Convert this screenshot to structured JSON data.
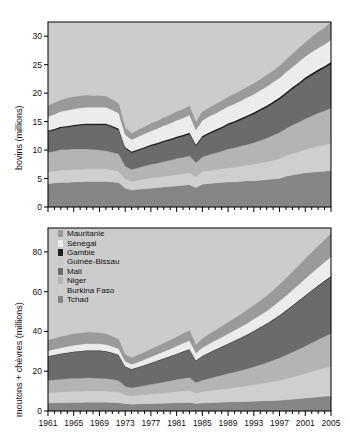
{
  "figure": {
    "background": "#ffffff",
    "plot_background": "#cccccc"
  },
  "legend": {
    "position": "inside-bottom-panel-top-left",
    "entries": [
      {
        "label": "Mauritanie",
        "color": "#9a9a9a"
      },
      {
        "label": "Sénégal",
        "color": "#ececec"
      },
      {
        "label": "Gambie",
        "color": "#1e1e1e"
      },
      {
        "label": "Guinée-Bissau",
        "color": "#c6c6c6"
      },
      {
        "label": "Mali",
        "color": "#6b6b6b"
      },
      {
        "label": "Niger",
        "color": "#b4b4b4"
      },
      {
        "label": "Burkina Faso",
        "color": "#cfcfcf"
      },
      {
        "label": "Tchad",
        "color": "#858585"
      }
    ]
  },
  "chart_data": [
    {
      "type": "area",
      "id": "bovins",
      "title": "",
      "xlabel": "",
      "ylabel": "bovins (millions)",
      "stacked": true,
      "grid": false,
      "xlim": [
        1961,
        2005
      ],
      "ylim": [
        0,
        32.5
      ],
      "yticks": [
        0,
        5,
        10,
        15,
        20,
        25,
        30
      ],
      "ytick_labels": [
        "0",
        "5",
        "10",
        "15",
        "20",
        "25",
        "30"
      ],
      "xticks": [
        1961,
        1965,
        1969,
        1973,
        1977,
        1981,
        1985,
        1989,
        1993,
        1997,
        2001,
        2005
      ],
      "xtick_labels": [
        "1961",
        "1965",
        "1969",
        "1973",
        "1977",
        "1981",
        "1985",
        "1989",
        "1993",
        "1997",
        "2001",
        "2005"
      ],
      "x": [
        1961,
        1962,
        1963,
        1964,
        1965,
        1966,
        1967,
        1968,
        1969,
        1970,
        1971,
        1972,
        1973,
        1974,
        1975,
        1976,
        1977,
        1978,
        1979,
        1980,
        1981,
        1982,
        1983,
        1984,
        1985,
        1986,
        1987,
        1988,
        1989,
        1990,
        1991,
        1992,
        1993,
        1994,
        1995,
        1996,
        1997,
        1998,
        1999,
        2000,
        2001,
        2002,
        2003,
        2004,
        2005
      ],
      "series": [
        {
          "name": "Tchad",
          "color": "#858585",
          "values": [
            4.1,
            4.2,
            4.3,
            4.3,
            4.4,
            4.4,
            4.5,
            4.5,
            4.5,
            4.5,
            4.4,
            4.3,
            3.3,
            3.0,
            3.1,
            3.2,
            3.3,
            3.4,
            3.5,
            3.6,
            3.7,
            3.8,
            3.9,
            3.4,
            4.0,
            4.1,
            4.2,
            4.3,
            4.4,
            4.4,
            4.5,
            4.6,
            4.6,
            4.7,
            4.8,
            4.9,
            5.0,
            5.4,
            5.6,
            5.8,
            6.0,
            6.1,
            6.2,
            6.3,
            6.4
          ]
        },
        {
          "name": "Burkina Faso",
          "color": "#cfcfcf",
          "values": [
            2.1,
            2.1,
            2.2,
            2.2,
            2.2,
            2.2,
            2.2,
            2.2,
            2.2,
            2.2,
            2.1,
            2.0,
            1.6,
            1.5,
            1.6,
            1.7,
            1.8,
            1.8,
            1.9,
            1.9,
            2.0,
            2.0,
            2.1,
            1.9,
            2.2,
            2.3,
            2.3,
            2.4,
            2.5,
            2.6,
            2.7,
            2.8,
            2.9,
            3.0,
            3.1,
            3.3,
            3.5,
            3.6,
            3.8,
            3.9,
            4.1,
            4.3,
            4.5,
            4.6,
            4.8
          ]
        },
        {
          "name": "Niger",
          "color": "#b4b4b4",
          "values": [
            3.4,
            3.5,
            3.6,
            3.6,
            3.6,
            3.6,
            3.5,
            3.4,
            3.3,
            3.2,
            3.1,
            3.0,
            2.3,
            2.1,
            2.2,
            2.3,
            2.4,
            2.5,
            2.6,
            2.7,
            2.8,
            2.9,
            3.0,
            2.5,
            2.6,
            2.8,
            3.0,
            3.1,
            3.3,
            3.4,
            3.5,
            3.6,
            3.8,
            4.0,
            4.2,
            4.4,
            4.6,
            4.8,
            5.0,
            5.2,
            5.4,
            5.6,
            5.8,
            6.0,
            6.2
          ]
        },
        {
          "name": "Mali",
          "color": "#6b6b6b",
          "values": [
            3.6,
            3.7,
            3.8,
            3.9,
            4.0,
            4.1,
            4.2,
            4.3,
            4.4,
            4.5,
            4.4,
            4.2,
            3.1,
            2.9,
            3.0,
            3.1,
            3.2,
            3.3,
            3.4,
            3.5,
            3.6,
            3.7,
            3.8,
            2.9,
            3.4,
            3.6,
            3.8,
            4.0,
            4.2,
            4.4,
            4.6,
            4.8,
            5.0,
            5.2,
            5.4,
            5.6,
            5.8,
            6.0,
            6.3,
            6.6,
            6.9,
            7.1,
            7.3,
            7.5,
            7.7
          ]
        },
        {
          "name": "Gambie",
          "color": "#1e1e1e",
          "values": [
            0.25,
            0.25,
            0.25,
            0.25,
            0.26,
            0.26,
            0.26,
            0.26,
            0.27,
            0.27,
            0.27,
            0.27,
            0.25,
            0.25,
            0.26,
            0.26,
            0.27,
            0.27,
            0.28,
            0.28,
            0.29,
            0.29,
            0.3,
            0.28,
            0.3,
            0.3,
            0.31,
            0.31,
            0.32,
            0.32,
            0.33,
            0.33,
            0.34,
            0.34,
            0.35,
            0.35,
            0.36,
            0.36,
            0.37,
            0.37,
            0.38,
            0.38,
            0.39,
            0.39,
            0.4
          ]
        },
        {
          "name": "Guinée-Bissau",
          "color": "#f2f2f2",
          "values": [
            0.23,
            0.23,
            0.24,
            0.24,
            0.25,
            0.25,
            0.26,
            0.26,
            0.27,
            0.27,
            0.28,
            0.28,
            0.27,
            0.27,
            0.28,
            0.29,
            0.3,
            0.31,
            0.32,
            0.33,
            0.34,
            0.35,
            0.36,
            0.35,
            0.38,
            0.39,
            0.4,
            0.41,
            0.42,
            0.43,
            0.44,
            0.45,
            0.46,
            0.47,
            0.48,
            0.49,
            0.5,
            0.51,
            0.52,
            0.53,
            0.54,
            0.55,
            0.56,
            0.57,
            0.58
          ]
        },
        {
          "name": "Sénégal",
          "color": "#ececec",
          "values": [
            2.2,
            2.3,
            2.4,
            2.5,
            2.5,
            2.6,
            2.6,
            2.6,
            2.6,
            2.6,
            2.5,
            2.4,
            1.9,
            1.8,
            1.9,
            2.0,
            2.1,
            2.2,
            2.3,
            2.4,
            2.5,
            2.6,
            2.7,
            2.2,
            2.3,
            2.4,
            2.4,
            2.5,
            2.5,
            2.6,
            2.6,
            2.7,
            2.7,
            2.8,
            2.8,
            2.9,
            2.9,
            3.0,
            3.0,
            3.1,
            3.1,
            3.2,
            3.2,
            3.2,
            3.3
          ]
        },
        {
          "name": "Mauritanie",
          "color": "#9a9a9a",
          "values": [
            1.9,
            2.0,
            2.0,
            2.1,
            2.1,
            2.1,
            2.1,
            2.0,
            2.0,
            1.9,
            1.8,
            1.7,
            1.2,
            1.1,
            1.2,
            1.2,
            1.3,
            1.3,
            1.4,
            1.4,
            1.5,
            1.5,
            1.6,
            1.4,
            1.5,
            1.5,
            1.6,
            1.6,
            1.7,
            1.7,
            1.8,
            1.8,
            1.9,
            1.9,
            2.0,
            2.0,
            2.1,
            2.2,
            2.3,
            2.4,
            2.5,
            2.6,
            2.8,
            2.9,
            3.1
          ]
        }
      ],
      "totals": [
        17.8,
        18.1,
        18.8,
        19.1,
        19.3,
        19.5,
        19.6,
        19.5,
        19.5,
        19.4,
        18.9,
        18.2,
        14.0,
        12.9,
        13.5,
        14.1,
        14.7,
        15.1,
        15.7,
        16.1,
        16.7,
        17.2,
        17.8,
        15.0,
        16.7,
        17.4,
        18.0,
        18.6,
        19.3,
        19.9,
        20.5,
        21.1,
        21.7,
        22.3,
        23.1,
        23.9,
        24.8,
        25.9,
        27.0,
        27.9,
        28.9,
        29.7,
        30.6,
        31.5,
        32.5
      ]
    },
    {
      "type": "area",
      "id": "moutons-chevres",
      "title": "",
      "xlabel": "",
      "ylabel": "moutons + chèvres (millions)",
      "stacked": true,
      "grid": false,
      "xlim": [
        1961,
        2005
      ],
      "ylim": [
        0,
        92
      ],
      "yticks": [
        0,
        20,
        40,
        60,
        80
      ],
      "ytick_labels": [
        "0",
        "20",
        "40",
        "60",
        "80"
      ],
      "xticks": [
        1961,
        1965,
        1969,
        1973,
        1977,
        1981,
        1985,
        1989,
        1993,
        1997,
        2001,
        2005
      ],
      "xtick_labels": [
        "1961",
        "1965",
        "1969",
        "1973",
        "1977",
        "1981",
        "1985",
        "1989",
        "1993",
        "1997",
        "2001",
        "2005"
      ],
      "x": [
        1961,
        1962,
        1963,
        1964,
        1965,
        1966,
        1967,
        1968,
        1969,
        1970,
        1971,
        1972,
        1973,
        1974,
        1975,
        1976,
        1977,
        1978,
        1979,
        1980,
        1981,
        1982,
        1983,
        1984,
        1985,
        1986,
        1987,
        1988,
        1989,
        1990,
        1991,
        1992,
        1993,
        1994,
        1995,
        1996,
        1997,
        1998,
        1999,
        2000,
        2001,
        2002,
        2003,
        2004,
        2005
      ],
      "series": [
        {
          "name": "Tchad",
          "color": "#858585",
          "values": [
            4.0,
            4.1,
            4.2,
            4.2,
            4.3,
            4.3,
            4.4,
            4.4,
            4.4,
            4.4,
            4.3,
            4.2,
            3.6,
            3.4,
            3.5,
            3.6,
            3.7,
            3.8,
            3.9,
            4.0,
            4.1,
            4.2,
            4.3,
            3.8,
            4.0,
            4.2,
            4.3,
            4.4,
            4.5,
            4.6,
            4.7,
            4.8,
            4.9,
            5.0,
            5.1,
            5.2,
            5.4,
            5.6,
            5.9,
            6.2,
            6.5,
            6.8,
            7.1,
            7.4,
            7.6
          ]
        },
        {
          "name": "Burkina Faso",
          "color": "#cfcfcf",
          "values": [
            5.2,
            5.3,
            5.4,
            5.5,
            5.6,
            5.6,
            5.7,
            5.7,
            5.7,
            5.6,
            5.5,
            5.3,
            4.4,
            4.2,
            4.4,
            4.6,
            4.8,
            5.0,
            5.2,
            5.4,
            5.6,
            5.8,
            6.0,
            5.2,
            5.7,
            6.0,
            6.3,
            6.6,
            6.9,
            7.2,
            7.5,
            7.9,
            8.3,
            8.7,
            9.1,
            9.6,
            10.1,
            10.6,
            11.2,
            11.8,
            12.4,
            13.0,
            13.6,
            14.2,
            14.8
          ]
        },
        {
          "name": "Niger",
          "color": "#b4b4b4",
          "values": [
            6.2,
            6.3,
            6.4,
            6.5,
            6.6,
            6.6,
            6.6,
            6.5,
            6.4,
            6.3,
            6.1,
            5.8,
            4.4,
            4.1,
            4.3,
            4.6,
            4.9,
            5.2,
            5.5,
            5.8,
            6.1,
            6.4,
            6.7,
            5.3,
            5.8,
            6.2,
            6.6,
            7.0,
            7.4,
            7.8,
            8.2,
            8.6,
            9.1,
            9.6,
            10.1,
            10.7,
            11.3,
            11.9,
            12.5,
            13.1,
            13.8,
            14.5,
            15.2,
            15.9,
            16.6
          ]
        },
        {
          "name": "Mali",
          "color": "#6b6b6b",
          "values": [
            12.0,
            12.3,
            12.6,
            12.9,
            13.2,
            13.4,
            13.6,
            13.7,
            13.7,
            13.6,
            13.2,
            12.7,
            9.8,
            9.2,
            9.6,
            10.1,
            10.6,
            11.1,
            11.6,
            12.1,
            12.7,
            13.3,
            13.9,
            10.9,
            12.0,
            12.7,
            13.4,
            14.1,
            14.8,
            15.5,
            16.2,
            16.9,
            17.7,
            18.5,
            19.3,
            20.2,
            21.1,
            22.1,
            23.1,
            24.1,
            25.1,
            26.0,
            26.8,
            27.6,
            28.4
          ]
        },
        {
          "name": "Gambie",
          "color": "#1e1e1e",
          "values": [
            0.25,
            0.25,
            0.26,
            0.26,
            0.27,
            0.27,
            0.28,
            0.28,
            0.28,
            0.28,
            0.28,
            0.27,
            0.26,
            0.26,
            0.27,
            0.27,
            0.28,
            0.28,
            0.29,
            0.29,
            0.3,
            0.3,
            0.31,
            0.29,
            0.31,
            0.32,
            0.32,
            0.33,
            0.34,
            0.34,
            0.35,
            0.36,
            0.36,
            0.37,
            0.38,
            0.39,
            0.4,
            0.41,
            0.42,
            0.43,
            0.44,
            0.45,
            0.46,
            0.47,
            0.48
          ]
        },
        {
          "name": "Guinée-Bissau",
          "color": "#f2f2f2",
          "values": [
            0.4,
            0.41,
            0.42,
            0.43,
            0.44,
            0.45,
            0.46,
            0.47,
            0.48,
            0.49,
            0.5,
            0.5,
            0.49,
            0.49,
            0.5,
            0.52,
            0.54,
            0.56,
            0.58,
            0.6,
            0.62,
            0.64,
            0.66,
            0.64,
            0.7,
            0.73,
            0.76,
            0.79,
            0.82,
            0.85,
            0.88,
            0.91,
            0.94,
            0.97,
            1.0,
            1.04,
            1.08,
            1.12,
            1.16,
            1.2,
            1.24,
            1.28,
            1.32,
            1.36,
            1.4
          ]
        },
        {
          "name": "Sénégal",
          "color": "#ececec",
          "values": [
            2.3,
            2.4,
            2.5,
            2.6,
            2.7,
            2.8,
            2.8,
            2.8,
            2.8,
            2.7,
            2.6,
            2.5,
            2.0,
            1.9,
            2.0,
            2.2,
            2.4,
            2.6,
            2.8,
            3.0,
            3.2,
            3.4,
            3.6,
            3.0,
            3.3,
            3.5,
            3.7,
            3.9,
            4.1,
            4.3,
            4.5,
            4.7,
            4.9,
            5.1,
            5.3,
            5.6,
            5.9,
            6.2,
            6.5,
            6.8,
            7.1,
            7.4,
            7.7,
            8.0,
            8.3
          ]
        },
        {
          "name": "Mauritanie",
          "color": "#9a9a9a",
          "values": [
            5.3,
            5.4,
            5.5,
            5.6,
            5.7,
            5.7,
            5.7,
            5.6,
            5.5,
            5.3,
            5.0,
            4.7,
            3.4,
            3.2,
            3.4,
            3.6,
            3.8,
            4.0,
            4.2,
            4.4,
            4.6,
            4.8,
            5.0,
            4.1,
            4.5,
            4.8,
            5.1,
            5.4,
            5.7,
            6.0,
            6.3,
            6.6,
            6.9,
            7.2,
            7.5,
            7.9,
            8.3,
            8.7,
            9.1,
            9.5,
            9.9,
            10.3,
            10.7,
            11.1,
            11.5
          ]
        }
      ],
      "totals": [
        35.7,
        36.5,
        37.3,
        38.0,
        38.8,
        39.1,
        39.5,
        39.5,
        39.3,
        38.7,
        37.5,
        36.0,
        28.4,
        26.8,
        28.0,
        29.5,
        31.0,
        32.5,
        34.1,
        35.6,
        37.2,
        38.8,
        40.5,
        33.3,
        36.3,
        38.5,
        40.5,
        42.5,
        44.6,
        46.6,
        48.6,
        50.8,
        53.1,
        55.4,
        57.7,
        60.6,
        63.6,
        66.6,
        69.9,
        73.1,
        76.5,
        79.8,
        82.9,
        86.0,
        89.1
      ]
    }
  ]
}
